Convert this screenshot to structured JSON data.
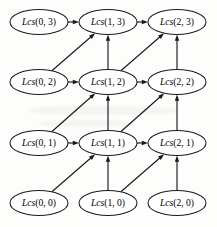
{
  "figure": {
    "background_color": "#fdfdfc",
    "stroke_color": "#1a1a1a",
    "node_fill_color": "#ffffff",
    "width": 217,
    "height": 227
  },
  "chart_data": {
    "type": "diagram",
    "subtype": "directed-acyclic-graph",
    "title": "",
    "xlabel": "",
    "ylabel": "",
    "grid": false,
    "legend": null,
    "columns": [
      0,
      1,
      2
    ],
    "rows": [
      0,
      1,
      2,
      3
    ],
    "node_label_prefix": "Lcs",
    "nodes": [
      {
        "id": "n_0_3",
        "label_fn": "Lcs",
        "label_args": "(0, 3)",
        "label": "Lcs(0, 3)",
        "col": 0,
        "row": 3,
        "cx": 39,
        "cy": 22,
        "rx": 29,
        "ry": 12.5
      },
      {
        "id": "n_1_3",
        "label_fn": "Lcs",
        "label_args": "(1, 3)",
        "label": "Lcs(1, 3)",
        "col": 1,
        "row": 3,
        "cx": 108,
        "cy": 22,
        "rx": 29,
        "ry": 12.5
      },
      {
        "id": "n_2_3",
        "label_fn": "Lcs",
        "label_args": "(2, 3)",
        "label": "Lcs(2, 3)",
        "col": 2,
        "row": 3,
        "cx": 177,
        "cy": 22,
        "rx": 29,
        "ry": 12.5
      },
      {
        "id": "n_0_2",
        "label_fn": "Lcs",
        "label_args": "(0, 2)",
        "label": "Lcs(0, 2)",
        "col": 0,
        "row": 2,
        "cx": 39,
        "cy": 82,
        "rx": 29,
        "ry": 12.5
      },
      {
        "id": "n_1_2",
        "label_fn": "Lcs",
        "label_args": "(1, 2)",
        "label": "Lcs(1, 2)",
        "col": 1,
        "row": 2,
        "cx": 108,
        "cy": 82,
        "rx": 29,
        "ry": 12.5
      },
      {
        "id": "n_2_2",
        "label_fn": "Lcs",
        "label_args": "(2, 2)",
        "label": "Lcs(2, 2)",
        "col": 2,
        "row": 2,
        "cx": 177,
        "cy": 82,
        "rx": 29,
        "ry": 12.5
      },
      {
        "id": "n_0_1",
        "label_fn": "Lcs",
        "label_args": "(0, 1)",
        "label": "Lcs(0, 1)",
        "col": 0,
        "row": 1,
        "cx": 39,
        "cy": 143,
        "rx": 29,
        "ry": 12.5
      },
      {
        "id": "n_1_1",
        "label_fn": "Lcs",
        "label_args": "(1, 1)",
        "label": "Lcs(1, 1)",
        "col": 1,
        "row": 1,
        "cx": 108,
        "cy": 143,
        "rx": 29,
        "ry": 12.5
      },
      {
        "id": "n_2_1",
        "label_fn": "Lcs",
        "label_args": "(2, 1)",
        "label": "Lcs(2, 1)",
        "col": 2,
        "row": 1,
        "cx": 177,
        "cy": 143,
        "rx": 29,
        "ry": 12.5
      },
      {
        "id": "n_0_0",
        "label_fn": "Lcs",
        "label_args": "(0, 0)",
        "label": "Lcs(0, 0)",
        "col": 0,
        "row": 0,
        "cx": 39,
        "cy": 203,
        "rx": 29,
        "ry": 12.5
      },
      {
        "id": "n_1_0",
        "label_fn": "Lcs",
        "label_args": "(1, 0)",
        "label": "Lcs(1, 0)",
        "col": 1,
        "row": 0,
        "cx": 108,
        "cy": 203,
        "rx": 29,
        "ry": 12.5
      },
      {
        "id": "n_2_0",
        "label_fn": "Lcs",
        "label_args": "(2, 0)",
        "label": "Lcs(2, 0)",
        "col": 2,
        "row": 0,
        "cx": 177,
        "cy": 203,
        "rx": 29,
        "ry": 12.5
      }
    ],
    "edges": [
      {
        "from": "n_0_3",
        "to": "n_1_3",
        "kind": "horizontal"
      },
      {
        "from": "n_1_3",
        "to": "n_2_3",
        "kind": "horizontal"
      },
      {
        "from": "n_0_2",
        "to": "n_1_2",
        "kind": "horizontal"
      },
      {
        "from": "n_1_2",
        "to": "n_2_2",
        "kind": "horizontal"
      },
      {
        "from": "n_0_1",
        "to": "n_1_1",
        "kind": "horizontal"
      },
      {
        "from": "n_1_1",
        "to": "n_2_1",
        "kind": "horizontal"
      },
      {
        "from": "n_1_2",
        "to": "n_1_3",
        "kind": "vertical"
      },
      {
        "from": "n_2_2",
        "to": "n_2_3",
        "kind": "vertical"
      },
      {
        "from": "n_1_1",
        "to": "n_1_2",
        "kind": "vertical"
      },
      {
        "from": "n_2_1",
        "to": "n_2_2",
        "kind": "vertical"
      },
      {
        "from": "n_1_0",
        "to": "n_1_1",
        "kind": "vertical"
      },
      {
        "from": "n_2_0",
        "to": "n_2_1",
        "kind": "vertical"
      },
      {
        "from": "n_0_2",
        "to": "n_1_3",
        "kind": "diagonal"
      },
      {
        "from": "n_1_2",
        "to": "n_2_3",
        "kind": "diagonal"
      },
      {
        "from": "n_0_1",
        "to": "n_1_2",
        "kind": "diagonal"
      },
      {
        "from": "n_1_1",
        "to": "n_2_2",
        "kind": "diagonal"
      },
      {
        "from": "n_0_0",
        "to": "n_1_1",
        "kind": "diagonal"
      },
      {
        "from": "n_1_0",
        "to": "n_2_1",
        "kind": "diagonal"
      }
    ]
  }
}
